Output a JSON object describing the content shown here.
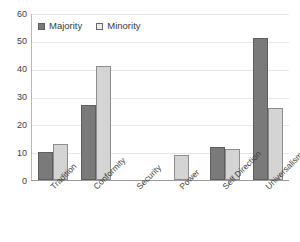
{
  "chart_data": {
    "type": "bar",
    "title": "",
    "subtitle": "",
    "xlabel": "",
    "ylabel": "",
    "ylim": [
      0,
      60
    ],
    "ytick_step": 10,
    "yticks": [
      60,
      50,
      40,
      30,
      20,
      10,
      0
    ],
    "grid": true,
    "legend_position": "top-left",
    "categories": [
      "Tradition",
      "Conformity",
      "Security",
      "Power",
      "Self Direction",
      "Universalism"
    ],
    "series": [
      {
        "name": "Majority",
        "color": "#7a7a7a",
        "values": [
          10,
          27,
          0,
          0,
          12,
          51
        ]
      },
      {
        "name": "Minority",
        "color": "#d4d4d4",
        "values": [
          13,
          41,
          0,
          9,
          11,
          26
        ]
      }
    ]
  },
  "legend": {
    "items": [
      {
        "label": "Majority",
        "swatch": "majority-swatch"
      },
      {
        "label": "Minority",
        "swatch": "minority-swatch"
      }
    ]
  },
  "colors": {
    "majority_fill": "#7a7a7a",
    "majority_border": "#5e5e5e",
    "minority_fill": "#d4d4d4",
    "minority_border": "#8d8d8d",
    "gridline": "#e6e6e6",
    "axis": "#9a9a9a",
    "background": "#ffffff"
  }
}
